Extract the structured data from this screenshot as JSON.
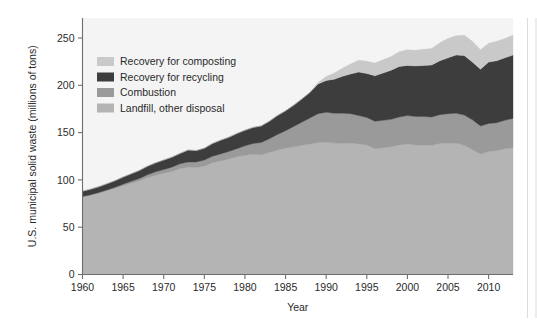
{
  "figure": {
    "background_color": "#ffffff",
    "plot_background_color": "#f4f4f4"
  },
  "chart_data": {
    "type": "area",
    "stacked": true,
    "title": "",
    "xlabel": "Year",
    "ylabel": "U.S. municipal solid waste (millions of tons)",
    "xlim": [
      1960,
      2013
    ],
    "ylim": [
      0,
      265
    ],
    "yticks": [
      0,
      50,
      100,
      150,
      200,
      250
    ],
    "ytick_labels": [
      "0",
      "50",
      "100",
      "150",
      "200",
      "250"
    ],
    "xticks": [
      1960,
      1965,
      1970,
      1975,
      1980,
      1985,
      1990,
      1995,
      2000,
      2005,
      2010
    ],
    "xtick_labels": [
      "1960",
      "1965",
      "1970",
      "1975",
      "1980",
      "1985",
      "1990",
      "1995",
      "2000",
      "2005",
      "2010"
    ],
    "grid": false,
    "legend_position": "upper-left-inside",
    "stack_order_bottom_to_top": [
      "Landfill, other disposal",
      "Combustion",
      "Recovery for recycling",
      "Recovery for composting"
    ],
    "x": [
      1960,
      1961,
      1962,
      1963,
      1964,
      1965,
      1966,
      1967,
      1968,
      1969,
      1970,
      1971,
      1972,
      1973,
      1974,
      1975,
      1976,
      1977,
      1978,
      1979,
      1980,
      1981,
      1982,
      1983,
      1984,
      1985,
      1986,
      1987,
      1988,
      1989,
      1990,
      1991,
      1992,
      1993,
      1994,
      1995,
      1996,
      1997,
      1998,
      1999,
      2000,
      2001,
      2002,
      2003,
      2004,
      2005,
      2006,
      2007,
      2008,
      2009,
      2010,
      2011,
      2012,
      2013
    ],
    "series": [
      {
        "name": "Landfill, other disposal",
        "color": "#b4b4b4",
        "values": [
          82.5,
          84.0,
          86.0,
          88.5,
          91.0,
          94.0,
          96.5,
          99.0,
          102.5,
          105.0,
          107.0,
          109.0,
          112.0,
          113.5,
          113.0,
          114.5,
          118.0,
          120.0,
          122.0,
          124.5,
          126.0,
          127.0,
          126.5,
          129.0,
          131.5,
          133.5,
          135.0,
          136.5,
          138.0,
          139.5,
          140.0,
          139.0,
          138.5,
          139.0,
          138.0,
          137.0,
          133.0,
          134.0,
          135.0,
          137.0,
          138.0,
          137.0,
          137.0,
          136.5,
          138.5,
          139.0,
          139.0,
          136.5,
          132.0,
          127.5,
          130.0,
          131.0,
          133.0,
          134.0
        ]
      },
      {
        "name": "Combustion",
        "color": "#9a9a9a",
        "values": [
          0.0,
          0.3,
          0.6,
          0.9,
          1.2,
          1.5,
          2.0,
          2.5,
          3.0,
          3.5,
          4.0,
          4.5,
          5.0,
          5.5,
          6.0,
          6.5,
          7.0,
          7.5,
          8.0,
          8.5,
          10.0,
          11.5,
          13.0,
          14.5,
          16.5,
          18.5,
          21.5,
          24.5,
          27.5,
          30.5,
          31.5,
          31.5,
          32.0,
          31.0,
          30.0,
          29.0,
          29.0,
          29.0,
          29.0,
          29.5,
          30.0,
          30.0,
          30.0,
          30.0,
          30.5,
          31.0,
          31.5,
          32.0,
          31.5,
          29.5,
          29.5,
          29.5,
          30.0,
          31.0
        ]
      },
      {
        "name": "Recovery for recycling",
        "color": "#3d3d3d",
        "values": [
          5.6,
          5.9,
          6.2,
          6.5,
          7.0,
          7.5,
          8.0,
          8.5,
          9.0,
          9.5,
          10.0,
          10.5,
          11.0,
          12.5,
          12.0,
          12.5,
          13.5,
          14.5,
          15.0,
          16.0,
          16.5,
          17.0,
          17.5,
          18.5,
          20.0,
          21.0,
          22.5,
          24.5,
          27.0,
          31.5,
          33.5,
          36.0,
          39.0,
          42.0,
          46.0,
          46.5,
          48.0,
          50.0,
          52.0,
          53.5,
          53.0,
          53.5,
          54.0,
          55.0,
          57.0,
          59.0,
          61.5,
          63.0,
          61.0,
          60.0,
          65.0,
          65.5,
          66.0,
          67.0
        ]
      },
      {
        "name": "Recovery for composting",
        "color": "#c9c9c9",
        "values": [
          0.0,
          0.0,
          0.0,
          0.0,
          0.0,
          0.0,
          0.0,
          0.0,
          0.0,
          0.0,
          0.0,
          0.0,
          0.0,
          0.0,
          0.0,
          0.0,
          0.0,
          0.0,
          0.0,
          0.0,
          0.0,
          0.0,
          0.0,
          0.0,
          0.0,
          0.0,
          0.0,
          0.0,
          0.5,
          1.5,
          4.2,
          6.5,
          8.5,
          10.5,
          12.5,
          13.0,
          13.5,
          14.0,
          14.5,
          15.5,
          16.5,
          16.5,
          17.0,
          17.5,
          19.0,
          20.5,
          20.5,
          21.5,
          22.0,
          20.5,
          20.0,
          20.5,
          20.5,
          21.0
        ]
      }
    ],
    "legend_entries": [
      {
        "label": "Recovery for composting",
        "color": "#c9c9c9"
      },
      {
        "label": "Recovery for recycling",
        "color": "#3d3d3d"
      },
      {
        "label": "Combustion",
        "color": "#9a9a9a"
      },
      {
        "label": "Landfill, other disposal",
        "color": "#b4b4b4"
      }
    ]
  }
}
